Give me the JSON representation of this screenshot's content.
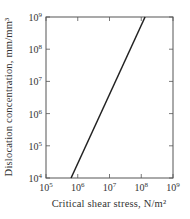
{
  "chart_data": {
    "type": "line",
    "title": "",
    "xlabel": "Critical shear stress, N/m²",
    "ylabel": "Dislocation concentration, mm/mm³",
    "xscale": "log",
    "yscale": "log",
    "xlim": [
      100000,
      1000000000
    ],
    "ylim": [
      10000,
      1000000000
    ],
    "x_ticks": [
      {
        "exp": 5,
        "label": "10",
        "sup": "5"
      },
      {
        "exp": 6,
        "label": "10",
        "sup": "6"
      },
      {
        "exp": 7,
        "label": "10",
        "sup": "7"
      },
      {
        "exp": 8,
        "label": "10",
        "sup": "8"
      },
      {
        "exp": 9,
        "label": "10",
        "sup": "9"
      }
    ],
    "y_ticks": [
      {
        "exp": 4,
        "label": "10",
        "sup": "4"
      },
      {
        "exp": 5,
        "label": "10",
        "sup": "5"
      },
      {
        "exp": 6,
        "label": "10",
        "sup": "6"
      },
      {
        "exp": 7,
        "label": "10",
        "sup": "7"
      },
      {
        "exp": 8,
        "label": "10",
        "sup": "8"
      },
      {
        "exp": 9,
        "label": "10",
        "sup": "9"
      }
    ],
    "grid": false,
    "legend": null,
    "series": [
      {
        "name": "dislocation concentration vs critical shear stress",
        "x": [
          610000,
          130000000
        ],
        "y": [
          10000,
          1000000000
        ],
        "log_x": [
          5.79,
          8.12
        ],
        "log_y": [
          4,
          9
        ]
      }
    ],
    "colors": {
      "line": "#222222",
      "frame": "#555555",
      "text": "#333333"
    }
  }
}
